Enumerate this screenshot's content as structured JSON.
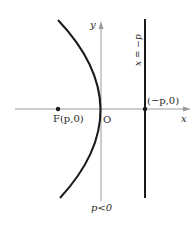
{
  "figure": {
    "colors": {
      "background": "#ffffff",
      "curve": "#1a1a1a",
      "axis": "#9a9a9a",
      "directrix": "#1a1a1a",
      "text": "#2a2a2a"
    },
    "axes": {
      "x_label": "x",
      "y_label": "y",
      "origin_label": "O"
    },
    "focus": {
      "label": "F(p,0)"
    },
    "directrix": {
      "equation_label": "x = −p",
      "intersection_label": "(−p,0)"
    },
    "condition_label": "p<0"
  }
}
